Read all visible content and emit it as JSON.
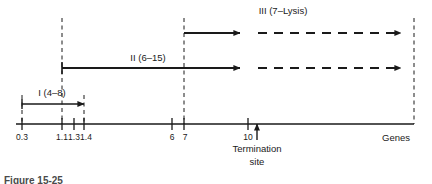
{
  "figure": {
    "type": "gene-transcription-unit-diagram",
    "axis_label": "Genes",
    "annotation": {
      "line1": "Termination",
      "line2": "site",
      "marker": "up-arrow"
    },
    "caption": "Figure 15-25",
    "colors": {
      "ink": "#1a1a1a",
      "background": "#ffffff",
      "caption": "#4a4a4a"
    },
    "axis": {
      "ticks": [
        {
          "label": "0.3",
          "x": 22
        },
        {
          "label": "1.1",
          "x": 62
        },
        {
          "label": "1.3",
          "x": 74
        },
        {
          "label": "1.4",
          "x": 84
        },
        {
          "label": "6",
          "x": 172
        },
        {
          "label": "7",
          "x": 184
        },
        {
          "label": "10",
          "x": 248
        }
      ],
      "x_start": 16,
      "x_end": 414
    },
    "transcripts": [
      {
        "id": "I",
        "label": "I (4–8)",
        "label_x": 52,
        "label_y": 88,
        "y": 104,
        "solid_start": 22,
        "solid_end": 84,
        "dashed_end": null,
        "arrow_at": 84
      },
      {
        "id": "II",
        "label": "II (6–15)",
        "label_x": 148,
        "label_y": 53,
        "y": 68,
        "solid_start": 62,
        "solid_end": 247,
        "dashed_end": 408,
        "arrow_at": 408
      },
      {
        "id": "III",
        "label": "III (7–Lysis)",
        "label_x": 283,
        "label_y": 6,
        "y": 33,
        "solid_start": 184,
        "solid_end": 247,
        "dashed_end": 408,
        "arrow_at": 408
      }
    ],
    "guide_lines": [
      {
        "x": 22,
        "y_top": 95,
        "y_bottom": 124
      },
      {
        "x": 62,
        "y_top": 18,
        "y_bottom": 124
      },
      {
        "x": 84,
        "y_top": 95,
        "y_bottom": 124
      },
      {
        "x": 184,
        "y_top": 18,
        "y_bottom": 124
      },
      {
        "x": 414,
        "y_top": 18,
        "y_bottom": 124
      }
    ],
    "termination": {
      "x": 257,
      "label_y": 146
    }
  }
}
